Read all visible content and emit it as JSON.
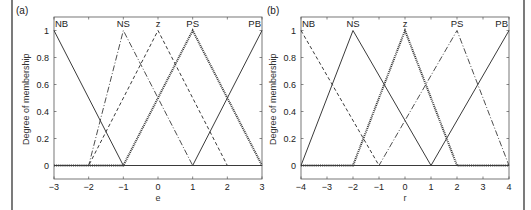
{
  "chart_data": [
    {
      "type": "line",
      "panel": "(a)",
      "title": "",
      "xlabel": "e",
      "ylabel": "Degree of membership",
      "xlim": [
        -3,
        3
      ],
      "ylim": [
        -0.1,
        1.1
      ],
      "xticks": [
        -3,
        -2,
        -1,
        0,
        1,
        2,
        3
      ],
      "xtick_labels": [
        "−3",
        "−2",
        "−1",
        "0",
        "1",
        "2",
        "3"
      ],
      "yticks": [
        0,
        0.2,
        0.4,
        0.6,
        0.8,
        1
      ],
      "ytick_labels": [
        "0",
        "0.2",
        "0.4",
        "0.6",
        "0.8",
        "1"
      ],
      "grid": false,
      "series": [
        {
          "name": "NB",
          "style": "solid",
          "x": [
            -3,
            -1,
            3
          ],
          "y": [
            1,
            0,
            0
          ]
        },
        {
          "name": "NS",
          "style": "dashdot",
          "x": [
            -3,
            -2,
            -1,
            1,
            3
          ],
          "y": [
            0,
            0,
            1,
            0,
            0
          ]
        },
        {
          "name": "z",
          "style": "dashed",
          "x": [
            -3,
            -2,
            0,
            2,
            3
          ],
          "y": [
            0,
            0,
            1,
            0,
            0
          ]
        },
        {
          "name": "PS",
          "style": "dotted",
          "x": [
            -3,
            -1,
            1,
            3
          ],
          "y": [
            0,
            0,
            1,
            0
          ]
        },
        {
          "name": "PB",
          "style": "solid",
          "x": [
            -3,
            1,
            3
          ],
          "y": [
            0,
            0,
            1
          ]
        }
      ],
      "annotations": [
        {
          "text": "NB",
          "x": -3
        },
        {
          "text": "NS",
          "x": -1
        },
        {
          "text": "z",
          "x": 0
        },
        {
          "text": "PS",
          "x": 1
        },
        {
          "text": "PB",
          "x": 3
        }
      ]
    },
    {
      "type": "line",
      "panel": "(b)",
      "title": "",
      "xlabel": "r",
      "ylabel": "Degree of membership",
      "xlim": [
        -4,
        4
      ],
      "ylim": [
        -0.1,
        1.1
      ],
      "xticks": [
        -4,
        -3,
        -2,
        -1,
        0,
        1,
        2,
        3,
        4
      ],
      "xtick_labels": [
        "−4",
        "−3",
        "−2",
        "−1",
        "0",
        "1",
        "2",
        "3",
        "4"
      ],
      "yticks": [
        0,
        0.2,
        0.4,
        0.6,
        0.8,
        1
      ],
      "ytick_labels": [
        "0",
        "0.2",
        "0.4",
        "0.6",
        "0.8",
        "1"
      ],
      "grid": false,
      "series": [
        {
          "name": "NB",
          "style": "dashed",
          "x": [
            -4,
            -1,
            4
          ],
          "y": [
            1,
            0,
            0
          ]
        },
        {
          "name": "NS",
          "style": "solid",
          "x": [
            -4,
            -2,
            1,
            4
          ],
          "y": [
            0,
            1,
            0,
            0
          ]
        },
        {
          "name": "z",
          "style": "dotted",
          "x": [
            -4,
            -2,
            0,
            2,
            4
          ],
          "y": [
            0,
            0,
            1,
            0,
            0
          ]
        },
        {
          "name": "PS",
          "style": "dashdot",
          "x": [
            -4,
            -1,
            2,
            4
          ],
          "y": [
            0,
            0,
            1,
            0
          ]
        },
        {
          "name": "PB",
          "style": "solid",
          "x": [
            -4,
            1,
            4
          ],
          "y": [
            0,
            0,
            1
          ]
        }
      ],
      "annotations": [
        {
          "text": "NB",
          "x": -4
        },
        {
          "text": "NS",
          "x": -2
        },
        {
          "text": "z",
          "x": 0
        },
        {
          "text": "PS",
          "x": 2
        },
        {
          "text": "PB",
          "x": 4
        }
      ]
    }
  ],
  "layout": {
    "panels": [
      {
        "left": 54,
        "right": 262,
        "y_top": 17,
        "y_bottom": 179,
        "label_x": 16,
        "label_y": 14
      },
      {
        "left": 301,
        "right": 509,
        "y_top": 17,
        "y_bottom": 179,
        "label_x": 267,
        "label_y": 14
      }
    ],
    "border_lines_x": [
      12,
      524
    ],
    "line_color": "#3a3a3a"
  }
}
